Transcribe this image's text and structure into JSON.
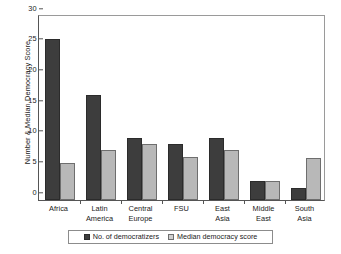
{
  "chart_data": {
    "type": "bar",
    "title": "",
    "xlabel": "",
    "ylabel": "Number & Median Democracy Score",
    "ylim": [
      0,
      30
    ],
    "yticks": [
      0,
      5,
      10,
      15,
      20,
      25,
      30
    ],
    "grid": false,
    "legend_position": "bottom",
    "categories": [
      "Africa",
      "Latin\nAmerica",
      "Central\nEurope",
      "FSU",
      "East\nAsia",
      "Middle\nEast",
      "South\nAsia"
    ],
    "series": [
      {
        "name": "No. of democratizers",
        "color": "#3d3d3d",
        "values": [
          26,
          17,
          10,
          9,
          10,
          3,
          2
        ]
      },
      {
        "name": "Median democracy score",
        "color": "#b8b8b8",
        "values": [
          6,
          8,
          9,
          7,
          8,
          3,
          6.7
        ]
      }
    ]
  }
}
